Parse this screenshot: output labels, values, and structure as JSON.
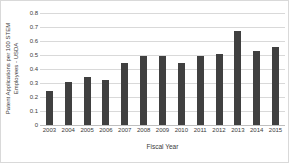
{
  "chart_data": {
    "type": "bar",
    "title": "",
    "subtitle": "",
    "xlabel": "Fiscal Year",
    "ylabel": "Patent Applications per 100 STEM Employees - USDA",
    "ylabel_lines": [
      "Patent Applications per 100 STEM",
      "Employees - USDA"
    ],
    "categories": [
      "2003",
      "2004",
      "2005",
      "2006",
      "2007",
      "2008",
      "2009",
      "2010",
      "2011",
      "2012",
      "2013",
      "2014",
      "2015"
    ],
    "values": [
      0.24,
      0.31,
      0.34,
      0.32,
      0.44,
      0.49,
      0.49,
      0.44,
      0.49,
      0.51,
      0.67,
      0.53,
      0.555
    ],
    "ylim": [
      0,
      0.8
    ],
    "xlim": null,
    "ytick_labels": [
      "0.8",
      "0.7",
      "0.6",
      "0.5",
      "0.4",
      "0.3",
      "0.2",
      "0.1",
      "0"
    ],
    "ytick_values": [
      0.8,
      0.7,
      0.6,
      0.5,
      0.4,
      0.3,
      0.2,
      0.1,
      0
    ],
    "grid": true,
    "grid_axis": "y",
    "legend": false,
    "legend_position": "none",
    "bar_color": "#404040",
    "gridline_color": "#d9d9d9",
    "axis_color": "#bfbfbf",
    "background_color": "#ffffff",
    "text_color": "#3a3a3a",
    "border_color": "#d9d9d9"
  }
}
